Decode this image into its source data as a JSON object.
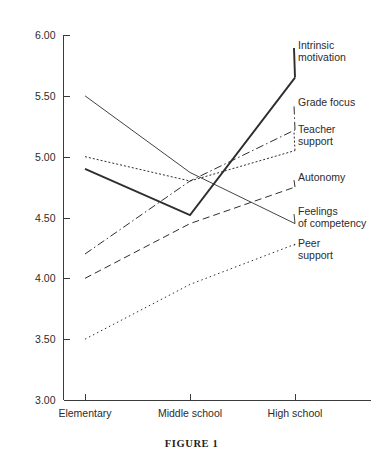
{
  "page": {
    "header_fragment": "",
    "caption": "FIGURE 1"
  },
  "chart_data": {
    "type": "line",
    "title": "",
    "subtitle": "",
    "xlabel": "",
    "ylabel": "",
    "categories": [
      "Elementary",
      "Middle school",
      "High school"
    ],
    "ylim": [
      3.0,
      6.0
    ],
    "yticks": [
      "3.00",
      "3.50",
      "4.00",
      "4.50",
      "5.00",
      "5.50",
      "6.00"
    ],
    "ytick_values": [
      3.0,
      3.5,
      4.0,
      4.5,
      5.0,
      5.5,
      6.0
    ],
    "grid": false,
    "legend_position": "right-inline-labels",
    "series": [
      {
        "name": "Intrinsic motivation",
        "label_lines": "Intrinsic\nmotivation",
        "style": "solid-thick",
        "values": [
          4.9,
          4.52,
          5.65
        ]
      },
      {
        "name": "Grade focus",
        "label_lines": "Grade focus",
        "style": "dash-dot",
        "values": [
          4.2,
          4.8,
          5.22
        ]
      },
      {
        "name": "Teacher support",
        "label_lines": "Teacher\nsupport",
        "style": "dotted",
        "values": [
          5.0,
          4.8,
          5.05
        ]
      },
      {
        "name": "Autonomy",
        "label_lines": "Autonomy",
        "style": "dashed",
        "values": [
          4.0,
          4.45,
          4.75
        ]
      },
      {
        "name": "Feelings of competency",
        "label_lines": "Feelings\nof competency",
        "style": "solid-thin",
        "values": [
          5.5,
          4.87,
          4.45
        ]
      },
      {
        "name": "Peer support",
        "label_lines": "Peer\nsupport",
        "style": "dotted-fine",
        "values": [
          3.5,
          3.95,
          4.28
        ]
      }
    ]
  },
  "legend_labels": [
    {
      "text": "Intrinsic\nmotivation",
      "top": 40,
      "left": 298
    },
    {
      "text": "Grade focus",
      "top": 97,
      "left": 298
    },
    {
      "text": "Teacher\nsupport",
      "top": 124,
      "left": 298
    },
    {
      "text": "Autonomy",
      "top": 172,
      "left": 298
    },
    {
      "text": "Feelings\nof competency",
      "top": 206,
      "left": 298
    },
    {
      "text": "Peer\nsupport",
      "top": 238,
      "left": 298
    }
  ]
}
